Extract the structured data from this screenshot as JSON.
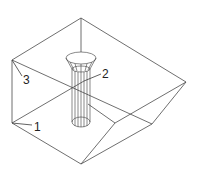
{
  "diagram": {
    "type": "isometric wireframe",
    "colors": {
      "line": "#4a4a4a",
      "text": "#222222",
      "background": "#ffffff"
    },
    "labels": [
      {
        "id": "1",
        "text": "1",
        "x": 34,
        "y": 131,
        "leader": [
          12,
          123,
          32,
          125
        ]
      },
      {
        "id": "2",
        "text": "2",
        "x": 102,
        "y": 78,
        "leader": [
          84,
          81,
          101,
          74
        ]
      },
      {
        "id": "3",
        "text": "3",
        "x": 23,
        "y": 84,
        "leader": [
          12,
          60,
          22,
          76
        ]
      }
    ]
  }
}
